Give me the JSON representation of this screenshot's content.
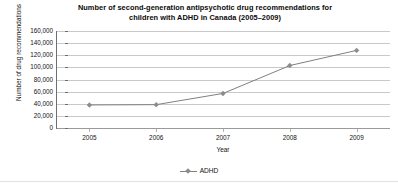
{
  "chart_data": {
    "type": "line",
    "title": "Number of second-generation antipsychotic drug recommendations for children with ADHD in Canada (2005–2009)",
    "title_line1": "Number of second-generation antipsychotic drug recommendations for",
    "title_line2": "children with ADHD in Canada (2005–2009)",
    "xlabel": "Year",
    "ylabel": "Number of drug recommendations",
    "categories": [
      "2005",
      "2006",
      "2007",
      "2008",
      "2009"
    ],
    "x": [
      2005,
      2006,
      2007,
      2008,
      2009
    ],
    "series": [
      {
        "name": "ADHD",
        "values": [
          38000,
          38500,
          57000,
          103000,
          128000
        ],
        "color": "#808080",
        "marker": "diamond"
      }
    ],
    "ylim": [
      0,
      160000
    ],
    "ytick_values": [
      0,
      20000,
      40000,
      60000,
      80000,
      100000,
      120000,
      140000,
      160000
    ],
    "ytick_labels": [
      "0",
      "20,000",
      "40,000",
      "60,000",
      "80,000",
      "100,000",
      "120,000",
      "140,000",
      "160,000"
    ],
    "grid": true,
    "grid_axis": "y",
    "legend": [
      "ADHD"
    ],
    "legend_position": "bottom",
    "colors": {
      "line": "#808080",
      "grid": "#c9c9c9",
      "axis": "#6f6f6f",
      "text": "#111111",
      "background": "#ffffff"
    }
  }
}
